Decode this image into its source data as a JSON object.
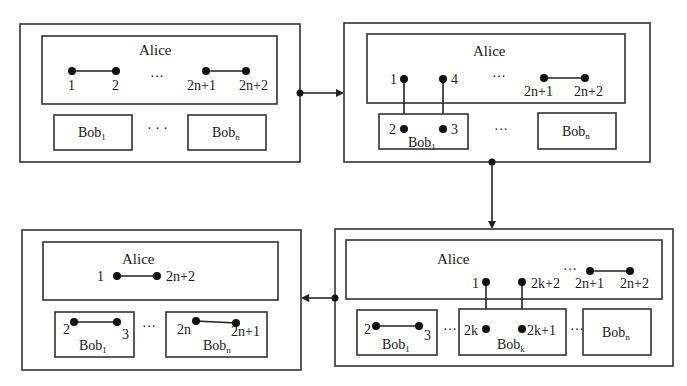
{
  "diagram": {
    "panels": [
      {
        "id": "step1",
        "alice": {
          "label": "Alice",
          "pairs": [
            {
              "left": "1",
              "right": "2"
            },
            {
              "left": "2n+1",
              "right": "2n+2"
            }
          ],
          "ellipsis": "···"
        },
        "bobs": [
          {
            "name": "Bob",
            "sub": "1"
          },
          {
            "name": "Bob",
            "sub": "n"
          }
        ],
        "bob_ellipsis": "· · ·"
      },
      {
        "id": "step2",
        "alice": {
          "label": "Alice",
          "nodes": [
            "1",
            "4"
          ],
          "pair": {
            "left": "2n+1",
            "right": "2n+2"
          },
          "ellipsis": "···"
        },
        "bobs": [
          {
            "name": "Bob",
            "sub": "1",
            "nodes": [
              "2",
              "3"
            ]
          },
          {
            "name": "Bob",
            "sub": "n"
          }
        ],
        "bob_ellipsis": "···"
      },
      {
        "id": "step3",
        "alice": {
          "label": "Alice",
          "nodes": [
            "1",
            "2k+2"
          ],
          "pair": {
            "left": "2n+1",
            "right": "2n+2"
          },
          "ellipsis": "···"
        },
        "bobs": [
          {
            "name": "Bob",
            "sub": "1",
            "pair": {
              "left": "2",
              "right": "3"
            }
          },
          {
            "name": "Bob",
            "sub": "k",
            "nodes": [
              "2k",
              "2k+1"
            ]
          },
          {
            "name": "Bob",
            "sub": "n"
          }
        ],
        "bob_ellipsis": "···"
      },
      {
        "id": "step4",
        "alice": {
          "label": "Alice",
          "pair": {
            "left": "1",
            "right": "2n+2"
          }
        },
        "bobs": [
          {
            "name": "Bob",
            "sub": "1",
            "pair": {
              "left": "2",
              "right": "3"
            }
          },
          {
            "name": "Bob",
            "sub": "n",
            "pair": {
              "left": "2n",
              "right": "2n+1"
            }
          }
        ],
        "bob_ellipsis": "···"
      }
    ],
    "flow": [
      "step1 → step2",
      "step2 ↓ step3",
      "step3 ← step4"
    ]
  }
}
